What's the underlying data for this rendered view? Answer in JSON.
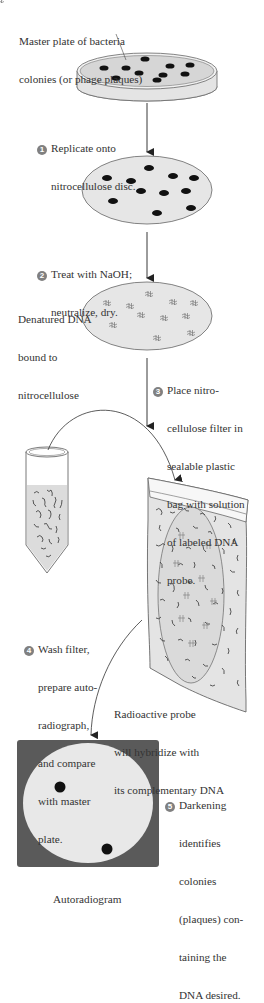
{
  "figure": {
    "labels": {
      "master_plate": [
        "Master plate of bacteria",
        "colonies (or phage plaques)"
      ],
      "denatured": [
        "Denatured DNA",
        "bound to",
        "nitrocellulose"
      ],
      "radioactive_probe": [
        "Radioactive probe",
        "will hybridize with",
        "its complementary DNA"
      ],
      "autoradiogram": "Autoradiogram"
    },
    "steps": [
      {
        "number": "1",
        "lines": [
          "Replicate onto",
          "nitrocellulose disc."
        ]
      },
      {
        "number": "2",
        "lines": [
          "Treat with NaOH;",
          "neutralize, dry."
        ]
      },
      {
        "number": "3",
        "lines": [
          "Place nitro-",
          "cellulose filter in",
          "sealable plastic",
          "bag with solution",
          "of labeled DNA",
          "probe."
        ]
      },
      {
        "number": "4",
        "lines": [
          "Wash filter,",
          "prepare auto-",
          "radiograph,",
          "and compare",
          "with master",
          "plate."
        ]
      },
      {
        "number": "5",
        "lines": [
          "Darkening",
          "identifies",
          "colonies",
          "(plaques) con-",
          "taining the",
          "DNA desired."
        ]
      }
    ],
    "colors": {
      "plate_fill": "#d6d6d6",
      "disc_fill": "#e6e6e6",
      "colony": "#111111",
      "step_badge": "#808080",
      "autoradiogram_bg": "#5a5a5a",
      "autoradiogram_disc": "#e8e8e8"
    }
  }
}
